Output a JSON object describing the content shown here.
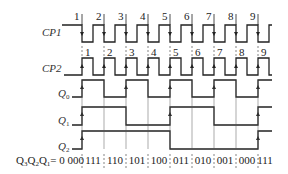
{
  "diagram": {
    "title": "",
    "signals": [
      {
        "name": "CP1",
        "label": "CP1"
      },
      {
        "name": "CP2",
        "label": "CP2"
      },
      {
        "name": "Q0",
        "label": "Q0"
      },
      {
        "name": "Q1",
        "label": "Q1"
      },
      {
        "name": "Q2",
        "label": "Q2"
      }
    ],
    "cp1_edge_labels": [
      "1",
      "2",
      "3",
      "4",
      "5",
      "6",
      "7",
      "8",
      "9"
    ],
    "cp2_edge_labels": [
      "1",
      "2",
      "3",
      "4",
      "5",
      "6",
      "7",
      "8",
      "9"
    ],
    "state_prefix": "Q₃Q₂Q₁= 0 000",
    "states": [
      "111",
      "110",
      "101",
      "100",
      "011",
      "010",
      "001",
      "000",
      "111"
    ],
    "edge_x": [
      82,
      104,
      126,
      148,
      170,
      192,
      214,
      236,
      258
    ],
    "q0_levels": [
      1,
      0,
      1,
      0,
      1,
      0,
      1,
      0,
      1
    ],
    "q1_levels": [
      1,
      1,
      0,
      0,
      1,
      1,
      0,
      0,
      1
    ],
    "q2_levels": [
      1,
      1,
      1,
      1,
      0,
      0,
      0,
      0,
      1
    ]
  }
}
